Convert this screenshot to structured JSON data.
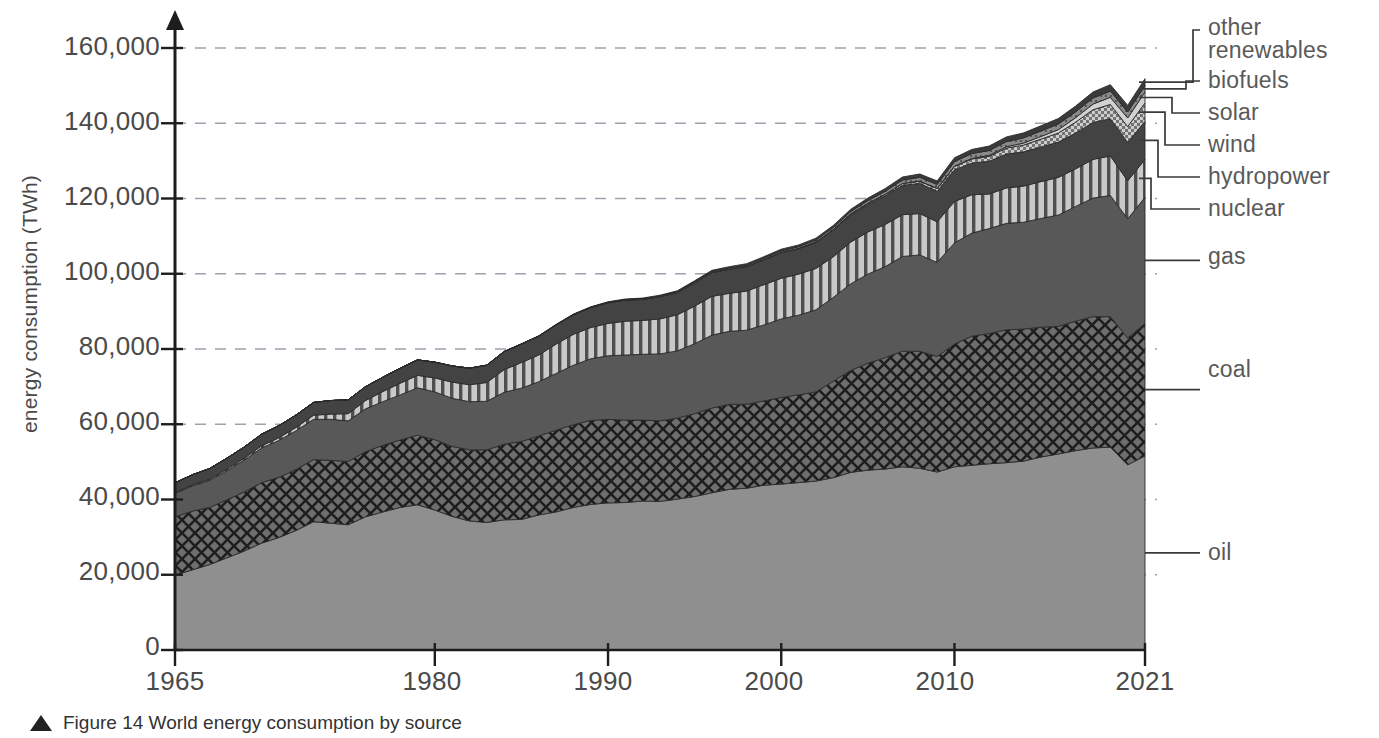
{
  "figure": {
    "caption_marker": "triangle-up",
    "caption": "Figure 14 World energy consumption by source"
  },
  "chart_data": {
    "type": "area",
    "stacked": true,
    "title": "World energy consumption by source",
    "xlabel": "",
    "ylabel": "energy consumption (TWh)",
    "xlim": [
      1965,
      2021
    ],
    "ylim": [
      0,
      168000
    ],
    "xticks": [
      1965,
      1980,
      1990,
      2000,
      2010,
      2021
    ],
    "xticklabels": [
      "1965",
      "1980",
      "1990",
      "2000",
      "2010",
      "2021"
    ],
    "yticks": [
      0,
      20000,
      40000,
      60000,
      80000,
      100000,
      120000,
      140000,
      160000
    ],
    "yticklabels": [
      "0",
      "20,000",
      "40,000",
      "60,000",
      "80,000",
      "100,000",
      "120,000",
      "140,000",
      "160,000"
    ],
    "grid": "horizontal-dashed",
    "legend_position": "right-leader-lines",
    "x": [
      1965,
      1966,
      1967,
      1968,
      1969,
      1970,
      1971,
      1972,
      1973,
      1974,
      1975,
      1976,
      1977,
      1978,
      1979,
      1980,
      1981,
      1982,
      1983,
      1984,
      1985,
      1986,
      1987,
      1988,
      1989,
      1990,
      1991,
      1992,
      1993,
      1994,
      1995,
      1996,
      1997,
      1998,
      1999,
      2000,
      2001,
      2002,
      2003,
      2004,
      2005,
      2006,
      2007,
      2008,
      2009,
      2010,
      2011,
      2012,
      2013,
      2014,
      2015,
      2016,
      2017,
      2018,
      2019,
      2020,
      2021
    ],
    "series": [
      {
        "name": "oil",
        "pattern": "solid-light-gray",
        "color": "#8f8f8f",
        "values": [
          19900,
          21300,
          22700,
          24500,
          26300,
          28400,
          29900,
          31800,
          34100,
          33700,
          33300,
          35400,
          36700,
          37900,
          38600,
          37200,
          35500,
          34300,
          33900,
          34600,
          34700,
          35900,
          36700,
          37900,
          38700,
          39100,
          39200,
          39600,
          39500,
          40100,
          40800,
          41800,
          42700,
          43000,
          43800,
          44100,
          44500,
          44900,
          45800,
          47200,
          47800,
          48100,
          48700,
          48300,
          47300,
          48700,
          49100,
          49500,
          49800,
          50200,
          51300,
          52100,
          53000,
          53700,
          53900,
          49200,
          51600
        ]
      },
      {
        "name": "coal",
        "pattern": "diagonal-crosshatch",
        "color": "#6b6b6b",
        "values": [
          15500,
          15600,
          15200,
          15400,
          15700,
          16100,
          16000,
          16200,
          16500,
          16700,
          16800,
          17300,
          17700,
          17900,
          18500,
          18700,
          18600,
          18900,
          19300,
          20100,
          20700,
          21000,
          21700,
          22000,
          22300,
          22200,
          21900,
          21500,
          21400,
          21500,
          22000,
          22500,
          22600,
          22300,
          22400,
          23000,
          23300,
          23700,
          25600,
          27100,
          28400,
          29600,
          30700,
          31100,
          30700,
          32600,
          34300,
          34600,
          35300,
          35100,
          34500,
          33900,
          34400,
          34900,
          34700,
          33700,
          35200
        ]
      },
      {
        "name": "gas",
        "pattern": "solid-dark-gray",
        "color": "#595959",
        "values": [
          6200,
          6700,
          7200,
          7800,
          8500,
          9200,
          9800,
          10300,
          10700,
          10900,
          10800,
          11400,
          11600,
          12000,
          12600,
          12700,
          12800,
          12800,
          12900,
          13800,
          14200,
          14400,
          15100,
          15800,
          16400,
          16900,
          17300,
          17500,
          17800,
          17900,
          18600,
          19400,
          19400,
          19700,
          20200,
          20900,
          21200,
          21800,
          22300,
          23000,
          23700,
          24200,
          25200,
          25600,
          25000,
          26900,
          27400,
          27900,
          28300,
          28400,
          28900,
          29600,
          30500,
          31500,
          32200,
          31700,
          33500
        ]
      },
      {
        "name": "nuclear",
        "pattern": "vertical-stripes",
        "color": "#a8a8a8",
        "values": [
          230,
          280,
          330,
          400,
          460,
          560,
          720,
          900,
          1100,
          1400,
          1900,
          2200,
          2700,
          3100,
          3300,
          3700,
          4300,
          4500,
          5000,
          6000,
          6800,
          7100,
          7800,
          8200,
          8300,
          8600,
          9000,
          9000,
          9300,
          9600,
          10000,
          10300,
          10100,
          10400,
          10700,
          10800,
          10900,
          11000,
          10800,
          11100,
          11200,
          11200,
          11100,
          11000,
          10800,
          11000,
          10200,
          9200,
          9400,
          9600,
          9800,
          10000,
          10000,
          10300,
          10500,
          10100,
          10100
        ]
      },
      {
        "name": "hydropower",
        "pattern": "solid-mid-dark",
        "color": "#4a4a4a",
        "values": [
          2600,
          2700,
          2800,
          2900,
          3000,
          3100,
          3200,
          3300,
          3400,
          3600,
          3700,
          3700,
          3800,
          4000,
          4100,
          4200,
          4300,
          4400,
          4600,
          4800,
          4900,
          5000,
          5100,
          5200,
          5300,
          5500,
          5600,
          5600,
          5900,
          5900,
          6200,
          6300,
          6400,
          6500,
          6600,
          6800,
          6700,
          6900,
          7000,
          7200,
          7300,
          7600,
          7800,
          8000,
          8100,
          8400,
          8400,
          8700,
          9000,
          9100,
          9200,
          9400,
          9500,
          9800,
          9900,
          10200,
          10100
        ]
      },
      {
        "name": "wind",
        "pattern": "dotted-checker",
        "color": "#bdbdbd",
        "values": [
          0,
          0,
          0,
          0,
          0,
          0,
          0,
          0,
          0,
          0,
          0,
          0,
          0,
          0,
          0,
          0,
          0,
          0,
          0,
          0,
          0,
          0,
          0,
          0,
          0,
          10,
          10,
          20,
          20,
          30,
          40,
          50,
          60,
          80,
          100,
          120,
          150,
          180,
          230,
          280,
          330,
          400,
          490,
          600,
          740,
          920,
          1100,
          1300,
          1600,
          1800,
          2100,
          2400,
          2900,
          3400,
          3800,
          4200,
          4900
        ]
      },
      {
        "name": "solar",
        "pattern": "light-gray-thin",
        "color": "#cfcfcf",
        "values": [
          0,
          0,
          0,
          0,
          0,
          0,
          0,
          0,
          0,
          0,
          0,
          0,
          0,
          0,
          0,
          0,
          0,
          0,
          0,
          0,
          0,
          0,
          0,
          0,
          0,
          0,
          0,
          0,
          0,
          0,
          0,
          0,
          0,
          0,
          0,
          0,
          0,
          0,
          0,
          0,
          10,
          10,
          20,
          30,
          50,
          80,
          140,
          250,
          370,
          530,
          700,
          900,
          1200,
          1500,
          1900,
          2300,
          2900
        ]
      },
      {
        "name": "biofuels",
        "pattern": "mid-gray-thin",
        "color": "#8a8a8a",
        "values": [
          0,
          0,
          0,
          0,
          0,
          0,
          0,
          0,
          0,
          0,
          0,
          0,
          0,
          0,
          0,
          0,
          0,
          0,
          0,
          30,
          40,
          50,
          60,
          80,
          90,
          100,
          120,
          140,
          170,
          200,
          230,
          260,
          290,
          320,
          350,
          380,
          420,
          470,
          530,
          600,
          680,
          790,
          900,
          1000,
          1050,
          1200,
          1300,
          1300,
          1350,
          1400,
          1450,
          1500,
          1550,
          1600,
          1650,
          1600,
          1700
        ]
      },
      {
        "name": "other renewables",
        "pattern": "dark-thin",
        "color": "#3d3d3d",
        "values": [
          0,
          0,
          0,
          0,
          0,
          0,
          0,
          0,
          0,
          0,
          0,
          0,
          0,
          0,
          10,
          10,
          20,
          20,
          30,
          40,
          50,
          60,
          80,
          100,
          120,
          140,
          160,
          180,
          210,
          240,
          270,
          300,
          330,
          370,
          400,
          440,
          470,
          510,
          560,
          620,
          680,
          740,
          810,
          880,
          930,
          1020,
          1100,
          1180,
          1250,
          1320,
          1390,
          1460,
          1540,
          1620,
          1700,
          1750,
          1850
        ]
      }
    ],
    "legend_entries": [
      {
        "label": "other",
        "label2": "renewables",
        "series": "other renewables"
      },
      {
        "label": "biofuels",
        "series": "biofuels"
      },
      {
        "label": "solar",
        "series": "solar"
      },
      {
        "label": "wind",
        "series": "wind"
      },
      {
        "label": "hydropower",
        "series": "hydropower"
      },
      {
        "label": "nuclear",
        "series": "nuclear"
      },
      {
        "label": "gas",
        "series": "gas"
      },
      {
        "label": "coal",
        "series": "coal"
      },
      {
        "label": "oil",
        "series": "oil"
      }
    ]
  }
}
